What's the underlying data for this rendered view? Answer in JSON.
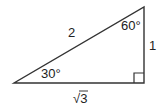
{
  "diagram": {
    "type": "right-triangle",
    "sides": {
      "hypotenuse": "2",
      "vertical_leg": "1",
      "horizontal_leg": "√3"
    },
    "angles": {
      "top_right": "60°",
      "bottom_left": "30°",
      "bottom_right": "right-angle"
    },
    "colors": {
      "stroke": "#333333",
      "text": "#222222",
      "background": "#ffffff"
    }
  }
}
